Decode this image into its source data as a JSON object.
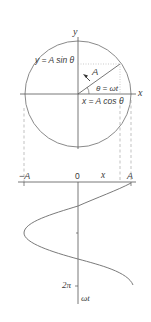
{
  "colors": {
    "line": "#555555",
    "circle": "#8a8a8a",
    "curve": "#7a7a7a",
    "dashed": "#9a9a9a",
    "text": "#3a3a3a"
  },
  "circle_plot": {
    "y_axis_label": "y",
    "x_axis_label": "x",
    "vector_label": "A",
    "angle_label": "θ = ωt",
    "projection_y_label": "y = A sin θ",
    "projection_x_label": "x = A cos θ"
  },
  "wave_plot": {
    "left_tick_label": "−A",
    "origin_label": "0",
    "x_label": "x",
    "right_tick_label": "A",
    "period_tick_label": "2π",
    "time_axis_label": "ωt"
  }
}
